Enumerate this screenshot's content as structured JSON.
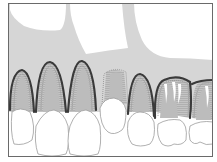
{
  "diagram": {
    "colors": {
      "background": "#ffffff",
      "frame": "#6a6a6a",
      "bone": "#d4d4d4",
      "sinus": "#ffffff",
      "gingiva_line": "#3c3c3c",
      "root": "#bdbdbd",
      "crown_fill": "#ffffff",
      "crown_stroke": "#9a9a9a",
      "hatch": "#a8a8a8"
    },
    "teeth": [
      {
        "id": "tooth-1",
        "type": "lateral incisor"
      },
      {
        "id": "tooth-2",
        "type": "central incisor"
      },
      {
        "id": "tooth-3",
        "type": "central incisor"
      },
      {
        "id": "tooth-4",
        "type": "lateral incisor (prepared)"
      },
      {
        "id": "tooth-5",
        "type": "canine"
      },
      {
        "id": "tooth-6",
        "type": "premolar"
      },
      {
        "id": "tooth-7",
        "type": "premolar"
      }
    ]
  }
}
